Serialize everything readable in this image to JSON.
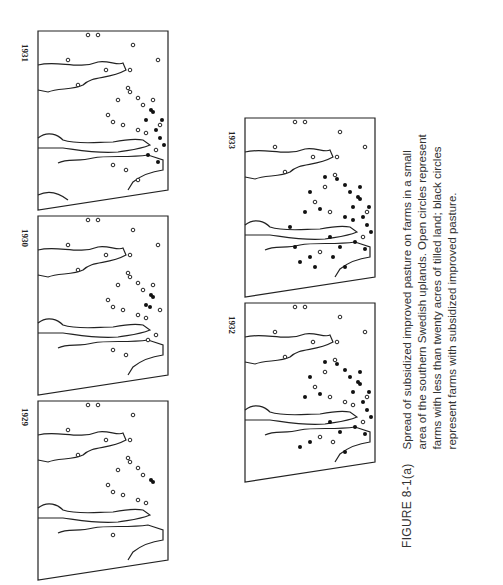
{
  "figure": {
    "label": "FIGURE 8-1(a)",
    "caption_lines": [
      "Spread of subsidized improved pasture on farms in a small",
      "area of the southern Swedish uplands. Open circles represent",
      "farms with less than twenty acres of tilled land; black circles",
      "represent farms with subsidized improved pasture."
    ],
    "orientation": "page rotated 90° counter-clockwise"
  },
  "legend": {
    "open_circle": "farms with less than twenty acres of tilled land",
    "black_circle": "farms with subsidized improved pasture"
  },
  "panels": [
    {
      "year": "1929",
      "black_count": 2
    },
    {
      "year": "1930",
      "black_count": 4
    },
    {
      "year": "1931",
      "black_count": 9
    },
    {
      "year": "1932",
      "black_count": 22
    },
    {
      "year": "1933",
      "black_count": 28
    }
  ]
}
